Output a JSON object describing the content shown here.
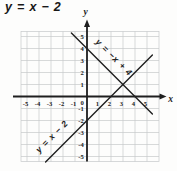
{
  "title": "y = x − 2",
  "chart_data": {
    "type": "line",
    "title": "y = x − 2",
    "xlabel": "x",
    "ylabel": "y",
    "origin_label": "0",
    "xlim": [
      -5,
      5
    ],
    "ylim": [
      -5,
      5
    ],
    "grid": true,
    "legend_position": "labels-along-lines",
    "x_tick_labels": [
      "-5",
      "-4",
      "-3",
      "-2",
      "-1",
      "1",
      "2",
      "3",
      "4",
      "5"
    ],
    "y_tick_labels": [
      "-5",
      "-4",
      "-3",
      "-2",
      "-1",
      "1",
      "2",
      "3",
      "4",
      "5"
    ],
    "series": [
      {
        "name": "y = −x + 4",
        "equation": "y = -x + 4",
        "slope": -1,
        "y_intercept": 4,
        "x_intercept": 4,
        "x": [
          -1.3,
          5.45
        ],
        "y": [
          5.3,
          -1.45
        ],
        "color": "#1f1f1f"
      },
      {
        "name": "y = x − 2",
        "equation": "y = x - 2",
        "slope": 1,
        "y_intercept": -2,
        "x_intercept": 2,
        "x": [
          -3.45,
          5.45
        ],
        "y": [
          -5.45,
          3.45
        ],
        "color": "#1f1f1f"
      }
    ],
    "intersection_point": [
      3,
      1
    ],
    "colors": {
      "grid": "#c5c8ca",
      "axis": "#1f1f1f",
      "background": "#fdfdfc"
    }
  }
}
